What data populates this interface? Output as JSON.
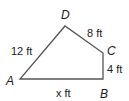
{
  "figure": {
    "type": "quadrilateral",
    "stroke_color": "#555555",
    "vertices": [
      {
        "name": "A",
        "x": 20,
        "y": 79
      },
      {
        "name": "B",
        "x": 103,
        "y": 79
      },
      {
        "name": "C",
        "x": 103,
        "y": 53
      },
      {
        "name": "D",
        "x": 65,
        "y": 26
      }
    ],
    "vertex_labels": {
      "A": "A",
      "B": "B",
      "C": "C",
      "D": "D"
    },
    "side_labels": {
      "AD": "12 ft",
      "DC": "8 ft",
      "CB": "4 ft",
      "AB": "x ft"
    }
  }
}
